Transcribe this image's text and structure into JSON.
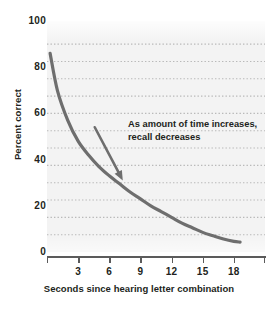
{
  "chart_data": {
    "type": "line",
    "title": "",
    "xlabel": "Seconds since hearing letter combination",
    "ylabel": "Percent correct",
    "xlim": [
      0,
      21
    ],
    "ylim": [
      0,
      100
    ],
    "grid": true,
    "grid_axis": "y",
    "legend": "none",
    "x_ticks": [
      3,
      6,
      9,
      12,
      15,
      18
    ],
    "y_ticks": [
      0,
      20,
      40,
      60,
      80,
      100
    ],
    "y_gridlines": [
      7.5,
      15,
      22.5,
      30,
      37.5,
      45,
      52.5,
      60,
      67.5,
      75,
      82.5,
      90
    ],
    "series": [
      {
        "name": "Recall accuracy",
        "color": "#6e6e6e",
        "x": [
          0.3,
          1,
          2,
          3,
          4,
          5,
          6,
          7,
          8,
          9,
          10,
          11,
          12,
          13,
          14,
          15,
          16,
          17,
          18,
          18.6
        ],
        "y": [
          86,
          70,
          57,
          48,
          42,
          37,
          33,
          29.5,
          26,
          23,
          20,
          17.5,
          15,
          12.5,
          10.5,
          8.5,
          7,
          5.6,
          4.6,
          4.3
        ]
      }
    ],
    "annotations": [
      {
        "name": "trend-callout",
        "text": "As amount of time increases, recall decreases",
        "line1": "As amount of time increases,",
        "line2": "recall decreases",
        "arrow_from": [
          4.6,
          54
        ],
        "arrow_to": [
          7.3,
          31
        ],
        "arrow_color": "#6e6e6e"
      }
    ]
  },
  "axes": {
    "y_title": "Percent correct",
    "x_title": "Seconds since hearing letter combination",
    "y_tick_labels": [
      "100",
      "80",
      "60",
      "40",
      "20",
      "0"
    ],
    "x_tick_labels": [
      "3",
      "6",
      "9",
      "12",
      "15",
      "18"
    ]
  },
  "colors": {
    "curve": "#6e6e6e",
    "panel_background": "#f3f3f3",
    "gridline": "#b9b9b9",
    "axis": "#5b5b5b",
    "text": "#221f20"
  }
}
